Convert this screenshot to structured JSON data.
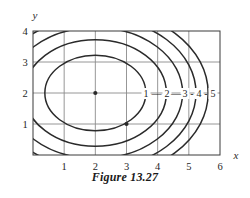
{
  "figure": {
    "caption": "Figure 13.27",
    "type": "contour-plot"
  },
  "axes": {
    "x_label": "x",
    "y_label": "y",
    "x_ticks": [
      "1",
      "2",
      "3",
      "4",
      "5",
      "6"
    ],
    "y_ticks": [
      "1",
      "2",
      "3",
      "4"
    ]
  },
  "chart_data": {
    "type": "contour",
    "title": "Figure 13.27",
    "xlabel": "x",
    "ylabel": "y",
    "xlim": [
      0,
      6
    ],
    "ylim": [
      0,
      4
    ],
    "x_ticks": [
      1,
      2,
      3,
      4,
      5,
      6
    ],
    "y_ticks": [
      1,
      2,
      3,
      4
    ],
    "grid": true,
    "center": [
      2,
      2
    ],
    "marked_points": [
      {
        "x": 2,
        "y": 2,
        "label": ""
      },
      {
        "x": 3,
        "y": 1,
        "label": ""
      }
    ],
    "levels": [
      1,
      2,
      3,
      4,
      5
    ],
    "level_labels": [
      "1",
      "2",
      "3",
      "4",
      "5"
    ],
    "label_separators": [
      "—",
      "—",
      "-",
      "-"
    ],
    "contours": [
      {
        "level": 1,
        "rx": 1.62,
        "ry": 1.22
      },
      {
        "level": 2,
        "rx": 2.28,
        "ry": 1.72
      },
      {
        "level": 3,
        "rx": 2.8,
        "ry": 2.11
      },
      {
        "level": 4,
        "rx": 3.23,
        "ry": 2.44
      },
      {
        "level": 5,
        "rx": 3.62,
        "ry": 2.72
      }
    ]
  },
  "colors": {
    "contour": "#2a2a2a",
    "grid": "#8b8b8b",
    "frame": "#3a3a3a",
    "text": "#1a1a1a",
    "background": "#ffffff"
  }
}
